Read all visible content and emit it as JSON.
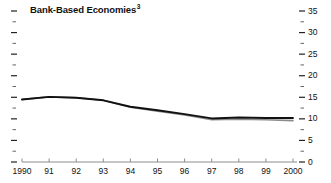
{
  "chart_data": {
    "type": "line",
    "title": "Bank-Based Economies",
    "title_superscript": "3",
    "xlabel": "",
    "ylabel": "",
    "x": [
      1990,
      1991,
      1992,
      1993,
      1994,
      1995,
      1996,
      1997,
      1998,
      1999,
      2000
    ],
    "x_tick_labels": [
      "1990",
      "91",
      "92",
      "93",
      "94",
      "95",
      "96",
      "97",
      "98",
      "99",
      "2000"
    ],
    "y_tick_labels": [
      "0",
      "5",
      "10",
      "15",
      "20",
      "25",
      "30",
      "35"
    ],
    "y_ticks": [
      0,
      5,
      10,
      15,
      20,
      25,
      30,
      35
    ],
    "y_minor_ticks": [
      2.5,
      7.5,
      12.5,
      17.5,
      22.5,
      27.5,
      32.5
    ],
    "ylim": [
      0,
      35
    ],
    "xlim": [
      1990,
      2000
    ],
    "grid": false,
    "legend": "none",
    "y_axis_position": "right",
    "series": [
      {
        "name": "series-dark",
        "color": "#111111",
        "width": 1.9,
        "values": [
          14.5,
          15.1,
          14.9,
          14.3,
          12.8,
          12.0,
          11.1,
          10.1,
          10.3,
          10.2,
          10.2
        ]
      },
      {
        "name": "series-gray",
        "color": "#8c8c8c",
        "width": 1.6,
        "values": [
          14.5,
          15.1,
          14.9,
          14.3,
          12.7,
          11.8,
          10.9,
          9.8,
          9.9,
          9.8,
          9.6
        ]
      }
    ]
  }
}
